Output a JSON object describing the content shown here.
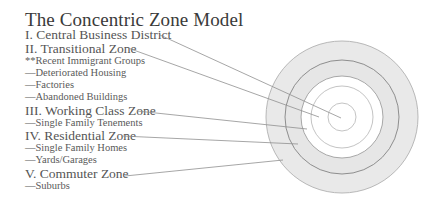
{
  "title": "The Concentric Zone Model",
  "items": [
    {
      "text": "I. Central Business District",
      "level": "main"
    },
    {
      "text": "II. Transitional Zone",
      "level": "main"
    },
    {
      "text": "**Recent Immigrant Groups",
      "level": "sub"
    },
    {
      "text": "—Deteriorated Housing",
      "level": "sub"
    },
    {
      "text": "—Factories",
      "level": "sub"
    },
    {
      "text": "—Abandoned Buildings",
      "level": "sub"
    },
    {
      "text": "III. Working Class Zone",
      "level": "main"
    },
    {
      "text": "—Single Family Tenements",
      "level": "sub"
    },
    {
      "text": "IV. Residential Zone",
      "level": "main"
    },
    {
      "text": "—Single Family Homes",
      "level": "sub"
    },
    {
      "text": "—Yards/Garages",
      "level": "sub"
    },
    {
      "text": "V. Commuter Zone",
      "level": "main"
    },
    {
      "text": "—Suburbs",
      "level": "sub"
    }
  ],
  "zones": [
    {
      "name": "Central Business District",
      "radius": 14
    },
    {
      "name": "Transitional Zone",
      "radius": 31
    },
    {
      "name": "Working Class Zone",
      "radius": 41
    },
    {
      "name": "Residential Zone",
      "radius": 57
    },
    {
      "name": "Commuter Zone",
      "radius": 76
    }
  ],
  "colors": {
    "ring_fill": "#e8e8e8",
    "ring_stroke": "#b5b5b5",
    "dark_ring_stroke": "#8a8a8a",
    "leader_line": "#9a9a9a",
    "text": "#555555",
    "title": "#3a3a3a"
  }
}
